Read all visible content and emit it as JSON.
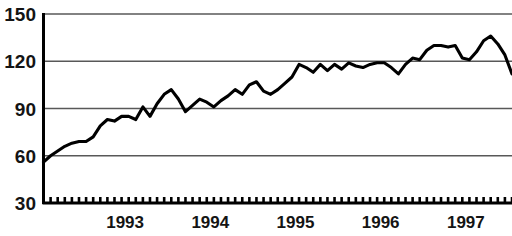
{
  "chart_data": {
    "type": "line",
    "title": "",
    "subtitle": "",
    "xlabel": "",
    "ylabel": "",
    "ylim": [
      30,
      150
    ],
    "yticks": [
      30,
      60,
      90,
      120,
      150
    ],
    "ytick_labels": [
      "30",
      "60",
      "90",
      "120",
      "150"
    ],
    "xtick_labels": [
      "1993",
      "1994",
      "1995",
      "1996",
      "1997"
    ],
    "x_axis_kind": "monthly-ticks",
    "grid": true,
    "legend": false,
    "legend_position": "none",
    "line_color": "#000000",
    "grid_color": "#585858",
    "background_color": "#ffffff",
    "x_start": "1992-07",
    "x_end": "1998-01",
    "x": [
      "1992-07",
      "1992-08",
      "1992-09",
      "1992-10",
      "1992-11",
      "1992-12",
      "1993-01",
      "1993-02",
      "1993-03",
      "1993-04",
      "1993-05",
      "1993-06",
      "1993-07",
      "1993-08",
      "1993-09",
      "1993-10",
      "1993-11",
      "1993-12",
      "1994-01",
      "1994-02",
      "1994-03",
      "1994-04",
      "1994-05",
      "1994-06",
      "1994-07",
      "1994-08",
      "1994-09",
      "1994-10",
      "1994-11",
      "1994-12",
      "1995-01",
      "1995-02",
      "1995-03",
      "1995-04",
      "1995-05",
      "1995-06",
      "1995-07",
      "1995-08",
      "1995-09",
      "1995-10",
      "1995-11",
      "1995-12",
      "1996-01",
      "1996-02",
      "1996-03",
      "1996-04",
      "1996-05",
      "1996-06",
      "1996-07",
      "1996-08",
      "1996-09",
      "1996-10",
      "1996-11",
      "1996-12",
      "1997-01",
      "1997-02",
      "1997-03",
      "1997-04",
      "1997-05",
      "1997-06",
      "1997-07",
      "1997-08",
      "1997-09",
      "1997-10",
      "1997-11",
      "1997-12",
      "1998-01"
    ],
    "values": [
      56,
      60,
      63,
      66,
      68,
      69,
      69,
      72,
      79,
      83,
      82,
      85,
      85,
      83,
      91,
      85,
      93,
      99,
      102,
      96,
      88,
      92,
      96,
      94,
      91,
      95,
      98,
      102,
      99,
      105,
      107,
      101,
      99,
      102,
      106,
      110,
      118,
      116,
      113,
      118,
      114,
      118,
      115,
      119,
      117,
      116,
      118,
      119,
      119,
      116,
      112,
      118,
      122,
      121,
      127,
      130,
      130,
      129,
      130,
      122,
      121,
      126,
      133,
      136,
      131,
      124,
      112
    ],
    "series": [
      {
        "name": "series-1",
        "values": [
          56,
          60,
          63,
          66,
          68,
          69,
          69,
          72,
          79,
          83,
          82,
          85,
          85,
          83,
          91,
          85,
          93,
          99,
          102,
          96,
          88,
          92,
          96,
          94,
          91,
          95,
          98,
          102,
          99,
          105,
          107,
          101,
          99,
          102,
          106,
          110,
          118,
          116,
          113,
          118,
          114,
          118,
          115,
          119,
          117,
          116,
          118,
          119,
          119,
          116,
          112,
          118,
          122,
          121,
          127,
          130,
          130,
          129,
          130,
          122,
          121,
          126,
          133,
          136,
          131,
          124,
          112
        ]
      }
    ]
  }
}
